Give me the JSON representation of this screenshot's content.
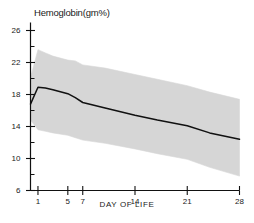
{
  "chart_data": {
    "type": "line",
    "title": "Hemoglobin(gm%)",
    "xlabel": "DAY OF LIFE",
    "ylabel": "",
    "xlim": [
      0,
      28
    ],
    "ylim": [
      6,
      27
    ],
    "xticks": [
      1,
      5,
      7,
      14,
      21,
      28
    ],
    "xtick_labels": [
      "1",
      "5",
      "7",
      "14",
      "21",
      "28"
    ],
    "yticks": [
      6,
      10,
      14,
      18,
      22,
      26
    ],
    "ytick_labels": [
      "6",
      "10",
      "14",
      "18",
      "22",
      "26"
    ],
    "yticks_minor": [
      8,
      12,
      16,
      20,
      24
    ],
    "grid": false,
    "legend": "none",
    "x": [
      0,
      1,
      2,
      3,
      5,
      6,
      7,
      10,
      14,
      17,
      21,
      24,
      28
    ],
    "series": [
      {
        "name": "Mean hemoglobin",
        "values": [
          16.8,
          18.9,
          18.8,
          18.6,
          18.1,
          17.6,
          17.0,
          16.3,
          15.4,
          14.8,
          14.1,
          13.2,
          12.4
        ],
        "color": "#111111",
        "style": "solid"
      }
    ],
    "band": {
      "name": "Range (mean ± 2 SD)",
      "color": "#d6d6d6",
      "upper": [
        20.1,
        23.6,
        23.2,
        22.8,
        22.3,
        22.2,
        21.7,
        21.3,
        20.5,
        19.9,
        19.1,
        18.3,
        17.4
      ],
      "lower": [
        14.8,
        13.6,
        13.4,
        13.2,
        12.9,
        12.6,
        12.3,
        11.9,
        11.2,
        10.6,
        9.9,
        8.9,
        7.8
      ]
    }
  },
  "axes": {
    "title": "Hemoglobin(gm%)",
    "xaxis_caption": "DAY OF LIFE"
  }
}
